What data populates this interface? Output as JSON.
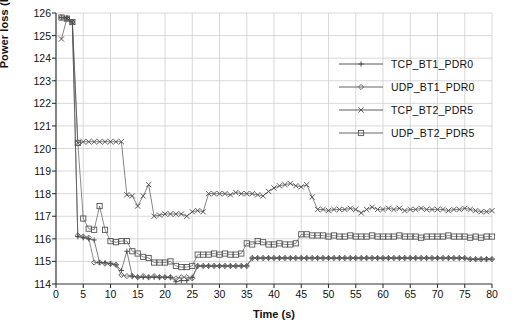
{
  "chart_data": {
    "type": "line",
    "title": "",
    "xlabel": "Time (s)",
    "ylabel": "Power loss (kw)",
    "xlim": [
      0,
      80
    ],
    "ylim": [
      114,
      126
    ],
    "xticks": [
      0,
      5,
      10,
      15,
      20,
      25,
      30,
      35,
      40,
      45,
      50,
      55,
      60,
      65,
      70,
      75,
      80
    ],
    "yticks": [
      114,
      115,
      116,
      117,
      118,
      119,
      120,
      121,
      122,
      123,
      124,
      125,
      126
    ],
    "grid": true,
    "legend_position": "upper-right",
    "series": [
      {
        "name": "TCP_BT1_PDR0",
        "marker": "plus",
        "color": "#444444",
        "x": [
          1,
          2,
          3,
          4,
          5,
          6,
          7,
          8,
          9,
          10,
          11,
          12,
          13,
          14,
          15,
          16,
          17,
          18,
          19,
          20,
          21,
          22,
          23,
          24,
          25,
          26,
          27,
          28,
          29,
          30,
          31,
          32,
          33,
          34,
          35,
          36,
          37,
          38,
          39,
          40,
          41,
          42,
          43,
          44,
          45,
          46,
          47,
          48,
          49,
          50,
          51,
          52,
          53,
          54,
          55,
          56,
          57,
          58,
          59,
          60,
          61,
          62,
          63,
          64,
          65,
          66,
          67,
          68,
          69,
          70,
          71,
          72,
          73,
          74,
          75,
          76,
          77,
          78,
          79,
          80
        ],
        "y": [
          125.8,
          125.8,
          125.6,
          116.1,
          116.05,
          116.0,
          115.95,
          114.95,
          114.95,
          114.9,
          114.85,
          114.6,
          115.45,
          114.35,
          114.3,
          114.3,
          114.3,
          114.3,
          114.3,
          114.3,
          114.3,
          114.1,
          114.15,
          114.15,
          114.3,
          114.8,
          114.8,
          114.8,
          114.8,
          114.8,
          114.8,
          114.8,
          114.8,
          114.8,
          114.8,
          115.15,
          115.15,
          115.15,
          115.15,
          115.15,
          115.15,
          115.15,
          115.15,
          115.15,
          115.15,
          115.15,
          115.15,
          115.15,
          115.15,
          115.15,
          115.15,
          115.15,
          115.15,
          115.15,
          115.15,
          115.15,
          115.15,
          115.15,
          115.15,
          115.15,
          115.15,
          115.15,
          115.15,
          115.15,
          115.15,
          115.15,
          115.15,
          115.15,
          115.15,
          115.15,
          115.15,
          115.15,
          115.15,
          115.15,
          115.15,
          115.1,
          115.1,
          115.1,
          115.1,
          115.1
        ]
      },
      {
        "name": "UDP_BT1_PDR0",
        "marker": "diamond",
        "color": "#555555",
        "x": [
          1,
          2,
          3,
          4,
          5,
          6,
          7,
          8,
          9,
          10,
          11,
          12,
          13,
          14,
          15,
          16,
          17,
          18,
          19,
          20,
          21,
          22,
          23,
          24,
          25,
          26,
          27,
          28,
          29,
          30,
          31,
          32,
          33,
          34,
          35,
          36,
          37,
          38,
          39,
          40,
          41,
          42,
          43,
          44,
          45,
          46,
          47,
          48,
          49,
          50,
          51,
          52,
          53,
          54,
          55,
          56,
          57,
          58,
          59,
          60,
          61,
          62,
          63,
          64,
          65,
          66,
          67,
          68,
          69,
          70,
          71,
          72,
          73,
          74,
          75,
          76,
          77,
          78,
          79,
          80
        ],
        "y": [
          125.8,
          125.75,
          125.6,
          116.15,
          116.1,
          116.05,
          114.95,
          114.95,
          114.9,
          114.9,
          114.85,
          114.4,
          114.35,
          114.35,
          114.3,
          114.35,
          114.3,
          114.35,
          114.3,
          114.3,
          114.3,
          114.25,
          114.3,
          114.3,
          114.25,
          114.8,
          114.8,
          114.8,
          114.8,
          114.8,
          114.8,
          114.8,
          114.8,
          114.8,
          114.8,
          115.15,
          115.15,
          115.15,
          115.15,
          115.15,
          115.15,
          115.15,
          115.15,
          115.15,
          115.15,
          115.15,
          115.15,
          115.15,
          115.15,
          115.15,
          115.15,
          115.15,
          115.15,
          115.15,
          115.15,
          115.15,
          115.15,
          115.15,
          115.15,
          115.15,
          115.15,
          115.15,
          115.15,
          115.15,
          115.15,
          115.15,
          115.15,
          115.15,
          115.15,
          115.15,
          115.15,
          115.15,
          115.15,
          115.15,
          115.15,
          115.1,
          115.1,
          115.1,
          115.1,
          115.1
        ]
      },
      {
        "name": "TCP_BT2_PDR5",
        "marker": "cross",
        "color": "#4a4a4a",
        "x": [
          1,
          2,
          3,
          4,
          5,
          6,
          7,
          8,
          9,
          10,
          11,
          12,
          13,
          14,
          15,
          16,
          17,
          18,
          19,
          20,
          21,
          22,
          23,
          24,
          25,
          26,
          27,
          28,
          29,
          30,
          31,
          32,
          33,
          34,
          35,
          36,
          37,
          38,
          39,
          40,
          41,
          42,
          43,
          44,
          45,
          46,
          47,
          48,
          49,
          50,
          51,
          52,
          53,
          54,
          55,
          56,
          57,
          58,
          59,
          60,
          61,
          62,
          63,
          64,
          65,
          66,
          67,
          68,
          69,
          70,
          71,
          72,
          73,
          74,
          75,
          76,
          77,
          78,
          79,
          80
        ],
        "y": [
          124.85,
          125.75,
          125.6,
          120.25,
          120.3,
          120.3,
          120.3,
          120.3,
          120.3,
          120.3,
          120.3,
          120.3,
          117.95,
          117.9,
          117.45,
          117.9,
          118.4,
          117.0,
          117.05,
          117.1,
          117.1,
          117.1,
          117.1,
          117.0,
          117.2,
          117.25,
          117.2,
          118.0,
          118.0,
          118.0,
          118.0,
          117.95,
          118.05,
          118.0,
          118.0,
          118.0,
          117.95,
          117.9,
          118.1,
          118.25,
          118.35,
          118.4,
          118.45,
          118.35,
          118.3,
          118.4,
          117.85,
          117.3,
          117.3,
          117.25,
          117.3,
          117.3,
          117.3,
          117.35,
          117.3,
          117.15,
          117.3,
          117.4,
          117.3,
          117.3,
          117.35,
          117.3,
          117.35,
          117.25,
          117.3,
          117.3,
          117.35,
          117.3,
          117.3,
          117.3,
          117.3,
          117.25,
          117.3,
          117.3,
          117.35,
          117.3,
          117.25,
          117.2,
          117.2,
          117.25
        ]
      },
      {
        "name": "UDP_BT2_PDR5",
        "marker": "square",
        "color": "#555555",
        "x": [
          1,
          2,
          3,
          4,
          5,
          6,
          7,
          8,
          9,
          10,
          11,
          12,
          13,
          14,
          15,
          16,
          17,
          18,
          19,
          20,
          21,
          22,
          23,
          24,
          25,
          26,
          27,
          28,
          29,
          30,
          31,
          32,
          33,
          34,
          35,
          36,
          37,
          38,
          39,
          40,
          41,
          42,
          43,
          44,
          45,
          46,
          47,
          48,
          49,
          50,
          51,
          52,
          53,
          54,
          55,
          56,
          57,
          58,
          59,
          60,
          61,
          62,
          63,
          64,
          65,
          66,
          67,
          68,
          69,
          70,
          71,
          72,
          73,
          74,
          75,
          76,
          77,
          78,
          79,
          80
        ],
        "y": [
          125.8,
          125.75,
          125.6,
          120.25,
          116.9,
          116.45,
          116.4,
          117.45,
          116.4,
          115.9,
          115.85,
          115.9,
          115.9,
          115.45,
          115.35,
          115.2,
          115.15,
          114.95,
          114.95,
          114.95,
          115.0,
          114.8,
          114.75,
          114.75,
          114.8,
          115.3,
          115.3,
          115.3,
          115.35,
          115.3,
          115.35,
          115.3,
          115.3,
          115.35,
          115.8,
          115.75,
          115.9,
          115.85,
          115.75,
          115.75,
          115.8,
          115.75,
          115.75,
          115.8,
          116.2,
          116.2,
          116.15,
          116.15,
          116.15,
          116.1,
          116.15,
          116.1,
          116.1,
          116.15,
          116.1,
          116.1,
          116.1,
          116.15,
          116.1,
          116.1,
          116.1,
          116.1,
          116.15,
          116.1,
          116.1,
          116.1,
          116.05,
          116.1,
          116.1,
          116.1,
          116.1,
          116.15,
          116.1,
          116.1,
          116.1,
          116.05,
          116.1,
          116.05,
          116.1,
          116.1
        ]
      }
    ]
  },
  "legend": {
    "items": [
      {
        "label": "TCP_BT1_PDR0"
      },
      {
        "label": "UDP_BT1_PDR0"
      },
      {
        "label": "TCP_BT2_PDR5"
      },
      {
        "label": "UDP_BT2_PDR5"
      }
    ]
  }
}
